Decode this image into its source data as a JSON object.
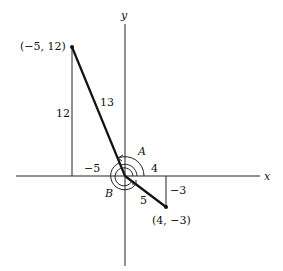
{
  "diagram": {
    "axes": {
      "x_label": "x",
      "y_label": "y"
    },
    "points": [
      {
        "label": "(−5, 12)",
        "x": -5,
        "y": 12
      },
      {
        "label": "(4, −3)",
        "x": 4,
        "y": -3
      }
    ],
    "segment_labels": {
      "hyp_upper": "13",
      "vertical_upper": "12",
      "horizontal_upper": "−5",
      "hyp_lower": "5",
      "vertical_lower": "−3",
      "horizontal_lower": "4"
    },
    "angle_labels": {
      "a": "A",
      "b": "B"
    },
    "colors": {
      "ink": "#111111",
      "background": "#ffffff"
    }
  }
}
